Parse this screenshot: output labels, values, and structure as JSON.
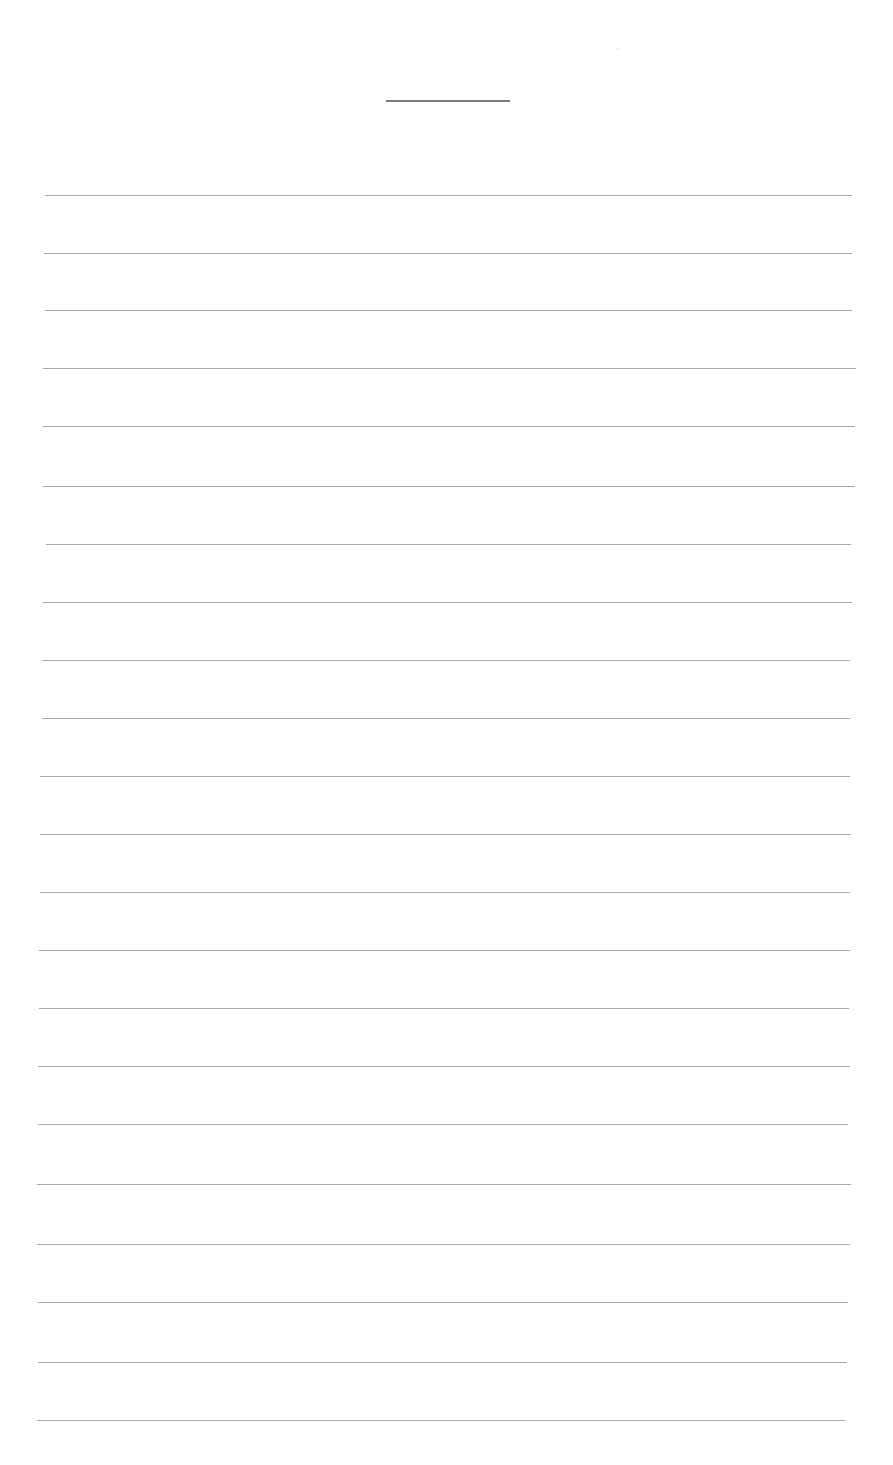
{
  "page": {
    "type": "blank lined paper",
    "title_line": {
      "present": true
    },
    "rule_count": 22,
    "rule_color": "#a9a9a9",
    "rules": [
      {
        "y": 195,
        "x1": 45,
        "x2": 852
      },
      {
        "y": 253,
        "x1": 44,
        "x2": 852
      },
      {
        "y": 310,
        "x1": 45,
        "x2": 852
      },
      {
        "y": 368,
        "x1": 43,
        "x2": 856
      },
      {
        "y": 426,
        "x1": 43,
        "x2": 855
      },
      {
        "y": 486,
        "x1": 43,
        "x2": 855
      },
      {
        "y": 544,
        "x1": 46,
        "x2": 851
      },
      {
        "y": 602,
        "x1": 43,
        "x2": 852
      },
      {
        "y": 660,
        "x1": 42,
        "x2": 850
      },
      {
        "y": 718,
        "x1": 42,
        "x2": 850
      },
      {
        "y": 776,
        "x1": 40,
        "x2": 850
      },
      {
        "y": 834,
        "x1": 40,
        "x2": 851
      },
      {
        "y": 892,
        "x1": 40,
        "x2": 850
      },
      {
        "y": 950,
        "x1": 39,
        "x2": 850
      },
      {
        "y": 1008,
        "x1": 39,
        "x2": 849
      },
      {
        "y": 1066,
        "x1": 38,
        "x2": 850
      },
      {
        "y": 1124,
        "x1": 38,
        "x2": 848
      },
      {
        "y": 1184,
        "x1": 37,
        "x2": 851
      },
      {
        "y": 1244,
        "x1": 37,
        "x2": 850
      },
      {
        "y": 1302,
        "x1": 38,
        "x2": 848
      },
      {
        "y": 1362,
        "x1": 38,
        "x2": 847
      },
      {
        "y": 1420,
        "x1": 37,
        "x2": 845
      }
    ]
  }
}
